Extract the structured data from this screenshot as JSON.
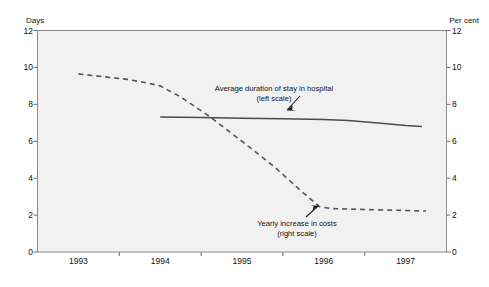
{
  "chart_data": {
    "type": "line",
    "title": "",
    "xlabel": "",
    "ylabel": "Days",
    "y2label": "Per cent",
    "xlim": [
      1992.5,
      1997.5
    ],
    "ylim": [
      0,
      12
    ],
    "y2lim": [
      0,
      12
    ],
    "grid": false,
    "legend_position": "inline-annotations",
    "x_tick_labels": [
      "1993",
      "1994",
      "1995",
      "1996",
      "1997"
    ],
    "x_tick_values": [
      1993,
      1994,
      1995,
      1996,
      1997
    ],
    "y_tick_labels": [
      "12",
      "10",
      "8",
      "6",
      "4",
      "2",
      "0"
    ],
    "y_tick_values": [
      12,
      10,
      8,
      6,
      4,
      2,
      0
    ],
    "y2_tick_labels": [
      "12",
      "10",
      "8",
      "6",
      "4",
      "2",
      "0"
    ],
    "y2_tick_values": [
      12,
      10,
      8,
      6,
      4,
      2,
      0
    ],
    "series": [
      {
        "name": "Average duration of stay in hospital",
        "scale": "left",
        "axis_note": "(left scale)",
        "style": "solid",
        "color": "#4a4a4a",
        "x": [
          1994.0,
          1994.25,
          1994.5,
          1995.0,
          1995.5,
          1996.0,
          1996.3,
          1996.7,
          1997.0,
          1997.2
        ],
        "values": [
          7.32,
          7.3,
          7.28,
          7.25,
          7.22,
          7.18,
          7.12,
          6.98,
          6.85,
          6.8
        ]
      },
      {
        "name": "Yearly increase in costs",
        "scale": "right",
        "axis_note": "(right scale)",
        "style": "dashed",
        "color": "#555555",
        "x": [
          1993.0,
          1993.3,
          1993.6,
          1993.85,
          1994.0,
          1994.25,
          1994.6,
          1995.0,
          1995.4,
          1995.75,
          1995.95,
          1996.1,
          1996.5,
          1997.0,
          1997.25
        ],
        "values": [
          9.65,
          9.5,
          9.35,
          9.15,
          9.0,
          8.4,
          7.35,
          6.0,
          4.6,
          3.2,
          2.45,
          2.35,
          2.3,
          2.25,
          2.22
        ]
      }
    ],
    "annotations": [
      {
        "id": "annot-solid",
        "line1": "Average duration of stay in hospital",
        "line2": "(left scale)",
        "arrow": "down-left"
      },
      {
        "id": "annot-dashed",
        "line1": "Yearly increase in costs",
        "line2": "(right scale)",
        "arrow": "up-right"
      }
    ]
  },
  "axes": {
    "left_unit": "Days",
    "right_unit": "Per cent"
  },
  "colors": {
    "plot_background": "#f1f1f1",
    "plot_border": "#8a8a8a",
    "solid_series": "#4a4a4a",
    "dashed_series": "#555555",
    "text": "#111111"
  }
}
